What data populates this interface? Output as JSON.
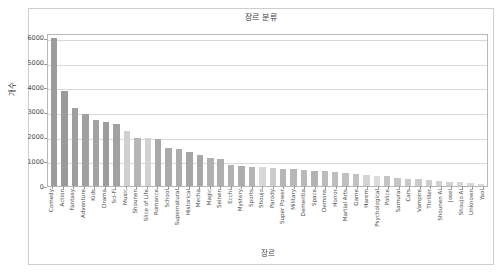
{
  "chart_data": {
    "type": "bar",
    "title": "장르 분류",
    "xlabel": "장르",
    "ylabel": "개수",
    "ylim": [
      0,
      6200
    ],
    "yticks": [
      0,
      1000,
      2000,
      3000,
      4000,
      5000,
      6000
    ],
    "ytick_labels": [
      "0",
      "1000",
      "2000",
      "3000",
      "4000",
      "5000",
      "6000"
    ],
    "grid": true,
    "legend": "none",
    "bar_color": "#9c9c9c",
    "categories": [
      "Comedy",
      "Action",
      "Fantasy",
      "Adventure",
      "Kids",
      "Drama",
      "Sci-Fi",
      "Music",
      "Shounen",
      "Slice of Life",
      "Romance",
      "School",
      "Supernatural",
      "Historical",
      "Mecha",
      "Magic",
      "Seinen",
      "Ecchi",
      "Mystery",
      "Sports",
      "Shoujo",
      "Parody",
      "Super Power",
      "Military",
      "Dementia",
      "Space",
      "Demons",
      "Horror",
      "Martial Arts",
      "Game",
      "Harem",
      "Psychological",
      "Police",
      "Samurai",
      "Cars",
      "Vampire",
      "Thriller",
      "Shounen Ai",
      "Josei",
      "Shoujo Ai",
      "Unknown",
      "Yaoi"
    ],
    "values": [
      5980,
      3840,
      3180,
      2930,
      2660,
      2580,
      2530,
      2230,
      1960,
      1930,
      1900,
      1540,
      1480,
      1380,
      1240,
      1130,
      1090,
      840,
      800,
      780,
      760,
      720,
      700,
      670,
      650,
      620,
      600,
      580,
      540,
      500,
      460,
      420,
      390,
      330,
      300,
      280,
      250,
      200,
      180,
      150,
      120,
      80
    ],
    "bar_shades": [
      "#9c9c9c",
      "#9a9a9a",
      "#9e9e9e",
      "#a0a0a0",
      "#a3a3a3",
      "#9d9d9d",
      "#a1a1a1",
      "#cfcfcf",
      "#b5b5b5",
      "#d2d2d2",
      "#a8a8a8",
      "#aaaaaa",
      "#acacac",
      "#a5a5a5",
      "#a7a7a7",
      "#b0b0b0",
      "#aeaeae",
      "#b2b2b2",
      "#adadad",
      "#b4b4b4",
      "#d8d8d8",
      "#cccccc",
      "#b6b6b6",
      "#b8b8b8",
      "#bababa",
      "#b3b3b3",
      "#bcbcbc",
      "#bebebe",
      "#c0c0c0",
      "#c2c2c2",
      "#d4d4d4",
      "#dcdcdc",
      "#c4c4c4",
      "#c6c6c6",
      "#c8c8c8",
      "#cacaca",
      "#cdcdcd",
      "#d0d0d0",
      "#d3d3d3",
      "#d6d6d6",
      "#d9d9d9",
      "#dbdbdb"
    ]
  }
}
